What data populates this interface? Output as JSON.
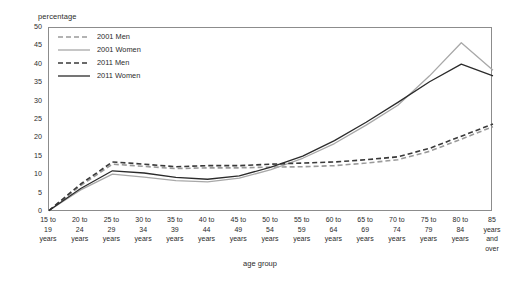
{
  "chart_data": {
    "type": "line",
    "title": "",
    "xlabel": "age group",
    "ylabel": "percentage",
    "ylim": [
      0,
      50
    ],
    "ytick_step": 5,
    "yticks": [
      "50",
      "45",
      "40",
      "35",
      "30",
      "25",
      "20",
      "15",
      "10",
      "5",
      "0"
    ],
    "grid": false,
    "legend_position": "top-left inside plot",
    "categories": [
      "15 to\n19\nyears",
      "20 to\n24\nyears",
      "25 to\n29\nyears",
      "30 to\n34\nyears",
      "35 to\n39\nyears",
      "40 to\n44\nyears",
      "45 to\n49\nyears",
      "50 to\n54\nyears",
      "55 to\n59\nyears",
      "60 to\n64\nyears",
      "65 to\n69\nyears",
      "70 to\n74\nyears",
      "75 to\n79\nyears",
      "80 to\n84\nyears",
      "85\nyears\nand\nover"
    ],
    "series": [
      {
        "name": "2001 Men",
        "color": "#9a9a9a",
        "style": "dashed",
        "values": [
          0.4,
          7.2,
          13.0,
          12.4,
          11.8,
          12.0,
          12.0,
          12.2,
          12.3,
          12.6,
          13.3,
          14.2,
          16.5,
          19.8,
          23.2
        ]
      },
      {
        "name": "2001 Women",
        "color": "#a8a8a8",
        "style": "solid",
        "values": [
          0.4,
          6.0,
          10.3,
          9.5,
          8.5,
          8.2,
          9.2,
          11.5,
          14.6,
          18.6,
          23.6,
          29.0,
          37.0,
          46.0,
          38.5
        ]
      },
      {
        "name": "2011 Men",
        "color": "#3a3a3a",
        "style": "dashed",
        "values": [
          0.4,
          7.6,
          13.6,
          13.0,
          12.3,
          12.6,
          12.6,
          13.0,
          13.3,
          13.6,
          14.2,
          15.0,
          17.3,
          20.6,
          23.9
        ]
      },
      {
        "name": "2011 Women",
        "color": "#2b2b2b",
        "style": "solid",
        "values": [
          0.4,
          6.4,
          11.2,
          10.6,
          9.4,
          8.9,
          9.8,
          12.2,
          15.2,
          19.4,
          24.4,
          29.8,
          35.4,
          40.2,
          37.0
        ]
      }
    ]
  },
  "legend": {
    "items": [
      {
        "label": "2001 Men"
      },
      {
        "label": "2001 Women"
      },
      {
        "label": "2011 Men"
      },
      {
        "label": "2011 Women"
      }
    ]
  }
}
